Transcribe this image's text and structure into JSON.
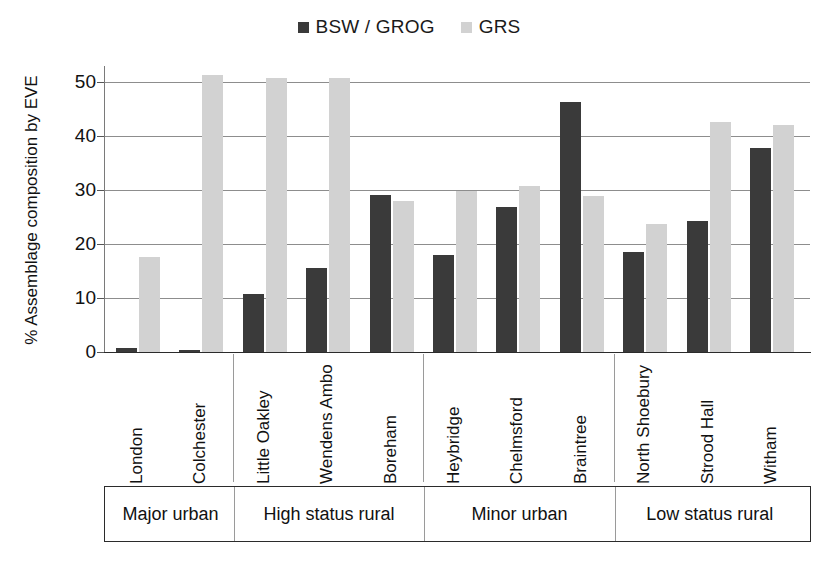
{
  "chart_data": {
    "type": "bar",
    "title": "",
    "xlabel": "",
    "ylabel": "% Assemblage composition by EVE",
    "ylim": [
      0,
      53
    ],
    "yticks": [
      0,
      10,
      20,
      30,
      40,
      50
    ],
    "ytick_labels": [
      "0",
      "10",
      "20",
      "30",
      "40",
      "50"
    ],
    "grid": true,
    "legend_position": "top-center",
    "categories": [
      "London",
      "Colchester",
      "Little Oakley",
      "Wendens Ambo",
      "Boreham",
      "Heybridge",
      "Chelmsford",
      "Braintree",
      "North Shoebury",
      "Strood Hall",
      "Witham"
    ],
    "series": [
      {
        "name": "BSW / GROG",
        "color": "#3a3a3a",
        "values": [
          0.7,
          0.3,
          10.7,
          15.5,
          29.1,
          18.0,
          26.8,
          46.4,
          18.6,
          24.2,
          37.8
        ]
      },
      {
        "name": "GRS",
        "color": "#d2d2d2",
        "values": [
          17.7,
          51.3,
          50.7,
          50.8,
          28.0,
          29.8,
          30.8,
          28.9,
          23.8,
          42.7,
          42.1
        ]
      }
    ],
    "groups": [
      {
        "label": "Major urban",
        "sites": [
          "London",
          "Colchester"
        ]
      },
      {
        "label": "High status rural",
        "sites": [
          "Little Oakley",
          "Wendens Ambo",
          "Boreham"
        ]
      },
      {
        "label": "Minor urban",
        "sites": [
          "Heybridge",
          "Chelmsford",
          "Braintree"
        ]
      },
      {
        "label": "Low status rural",
        "sites": [
          "North Shoebury",
          "Strood Hall",
          "Witham"
        ]
      }
    ]
  },
  "legend": {
    "entries": [
      {
        "label": "BSW / GROG",
        "color": "#3a3a3a"
      },
      {
        "label": "GRS",
        "color": "#d2d2d2"
      }
    ]
  },
  "axis": {
    "y_title": "% Assemblage composition by EVE"
  },
  "colors": {
    "series_dark": "#3a3a3a",
    "series_light": "#d2d2d2",
    "gridline": "#8d8d8d",
    "axis": "#2b2b2b",
    "text": "#111111",
    "background": "#ffffff"
  }
}
